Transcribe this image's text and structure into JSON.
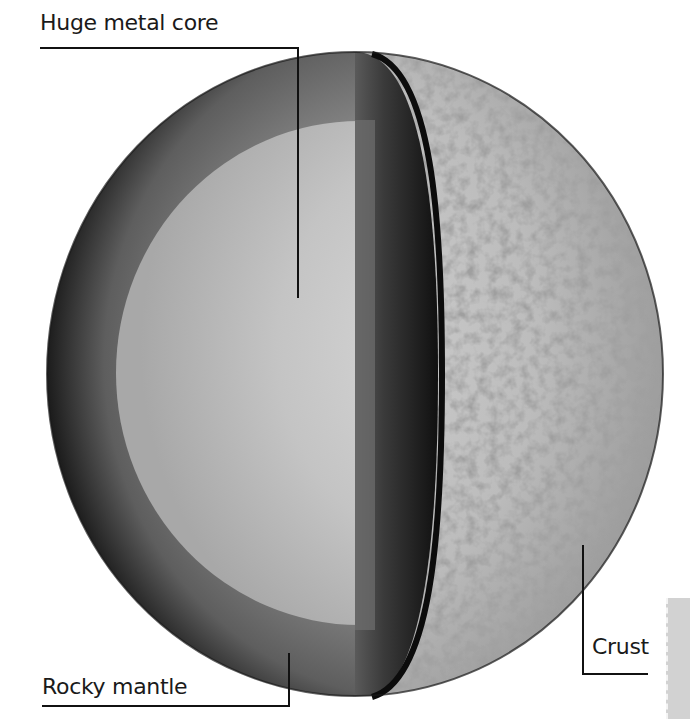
{
  "diagram": {
    "labels": {
      "core": "Huge metal core",
      "mantle": "Rocky mantle",
      "crust": "Crust"
    },
    "layers": [
      {
        "name": "core",
        "color": "#c8c8c8"
      },
      {
        "name": "mantle",
        "color": "#7a7a7a"
      },
      {
        "name": "crust",
        "color": "#b9b9b9"
      }
    ],
    "colors": {
      "background": "#ffffff",
      "leader_line": "#111111",
      "label_text": "#1a1a1a",
      "cut_face_dark": "#1e1e1e"
    }
  }
}
